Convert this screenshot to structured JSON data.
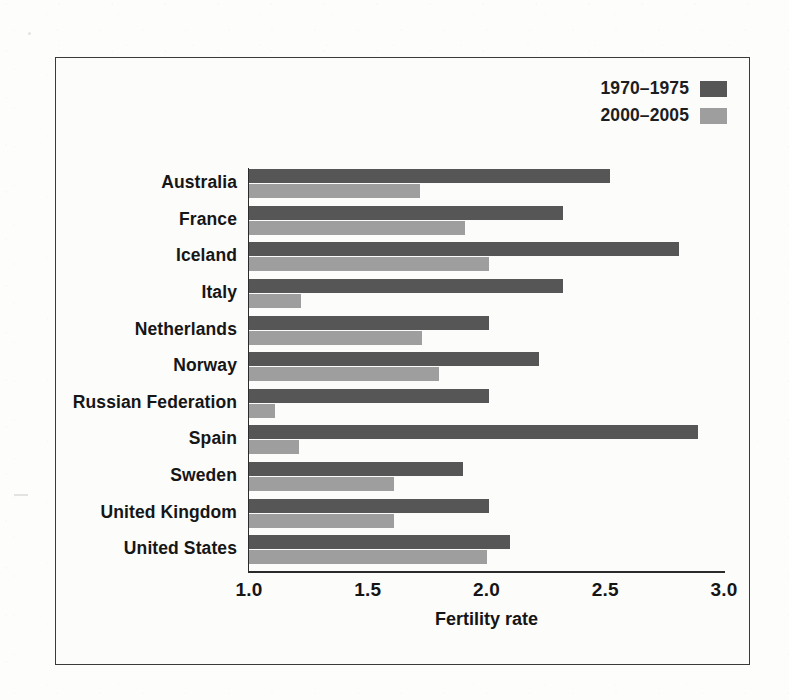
{
  "figure": {
    "background_color": "#fcfcfb",
    "frame_color": "#3a3a3a"
  },
  "legend": {
    "position": "top-right",
    "entries": [
      {
        "label": "1970–1975",
        "color": "#565656",
        "swatch_name": "legend-swatch-1970-1975"
      },
      {
        "label": "2000–2005",
        "color": "#9e9e9e",
        "swatch_name": "legend-swatch-2000-2005"
      }
    ]
  },
  "axis": {
    "x_title": "Fertility rate",
    "x_ticks": [
      "1.0",
      "1.5",
      "2.0",
      "2.5",
      "3.0"
    ],
    "x_min": 1.0,
    "x_max": 3.0,
    "x_step": 0.5
  },
  "chart_data": {
    "type": "bar",
    "orientation": "horizontal",
    "title": "",
    "xlabel": "Fertility rate",
    "ylabel": "",
    "xlim": [
      1.0,
      3.0
    ],
    "grid": false,
    "legend_position": "top-right",
    "categories": [
      "Australia",
      "France",
      "Iceland",
      "Italy",
      "Netherlands",
      "Norway",
      "Russian Federation",
      "Spain",
      "Sweden",
      "United Kingdom",
      "United States"
    ],
    "series": [
      {
        "name": "1970–1975",
        "color": "#565656",
        "values": [
          2.52,
          2.32,
          2.81,
          2.32,
          2.01,
          2.22,
          2.01,
          2.89,
          1.9,
          2.01,
          2.1
        ]
      },
      {
        "name": "2000–2005",
        "color": "#9e9e9e",
        "values": [
          1.72,
          1.91,
          2.01,
          1.22,
          1.73,
          1.8,
          1.11,
          1.21,
          1.61,
          1.61,
          2.0
        ]
      }
    ]
  }
}
